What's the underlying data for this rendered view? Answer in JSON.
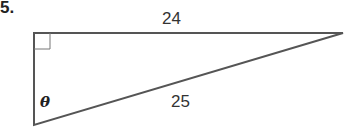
{
  "problem": {
    "number": "5.",
    "top_side_label": "24",
    "hypotenuse_label": "25",
    "angle_label": "θ"
  },
  "colors": {
    "stroke": "#555555",
    "text": "#222222"
  }
}
